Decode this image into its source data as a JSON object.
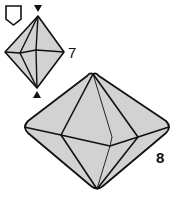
{
  "steps": [
    {
      "number": "7",
      "description": "small octahedron with rotation markers"
    },
    {
      "number": "8",
      "description": "completed octahedron"
    }
  ],
  "icons": {
    "pentagon": "pentagon-base-icon",
    "top_marker": "triangle-down-icon",
    "bottom_marker": "triangle-up-icon"
  },
  "colors": {
    "fill": "#d2d2d2",
    "stroke": "#111111"
  }
}
